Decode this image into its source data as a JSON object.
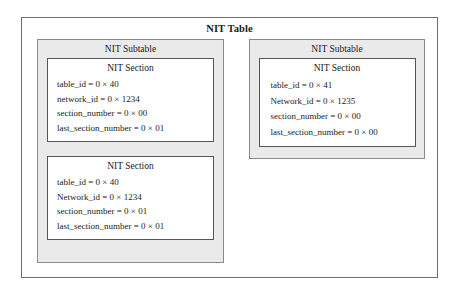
{
  "diagram": {
    "title": "NIT Table",
    "subtable_label": "NIT Subtable",
    "section_label": "NIT Section",
    "colors": {
      "page_background": "#ffffff",
      "subtable_fill": "#eaeaea",
      "section_fill": "#ffffff",
      "outer_border": "#6e6e6e",
      "subtable_border": "#8a8a8a",
      "section_border": "#555555",
      "text": "#1a1a1a"
    },
    "subtables": [
      {
        "label": "NIT Subtable",
        "sections": [
          {
            "label": "NIT Section",
            "fields": [
              "table_id = 0 × 40",
              "network_id = 0 × 1234",
              "section_number = 0 × 00",
              "last_section_number = 0 × 01"
            ]
          },
          {
            "label": "NIT Section",
            "fields": [
              "table_id = 0 × 40",
              "Network_id = 0 × 1234",
              "section_number = 0 × 01",
              "last_section_number = 0 × 01"
            ]
          }
        ]
      },
      {
        "label": "NIT Subtable",
        "sections": [
          {
            "label": "NIT Section",
            "fields": [
              "table_id = 0 × 41",
              "Network_id = 0 × 1235",
              "section_number = 0 × 00",
              "last_section_number = 0 × 00"
            ]
          }
        ]
      }
    ]
  }
}
